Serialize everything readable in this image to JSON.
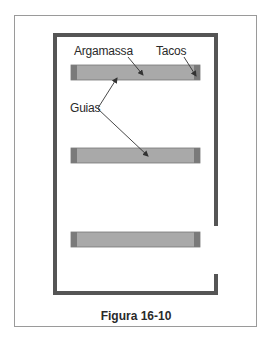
{
  "figure": {
    "caption": "Figura 16-10",
    "labels": {
      "mortar": "Argamassa",
      "blocks": "Tacos",
      "guides": "Guias"
    },
    "colors": {
      "wall": "#555555",
      "bar_fill": "#a9a9a9",
      "bar_end": "#7a7a7a",
      "frame_border": "#9a9a9a",
      "arrow": "#333333"
    },
    "bars": [
      {
        "name": "guide-bar-1"
      },
      {
        "name": "guide-bar-2"
      },
      {
        "name": "guide-bar-3"
      }
    ]
  }
}
